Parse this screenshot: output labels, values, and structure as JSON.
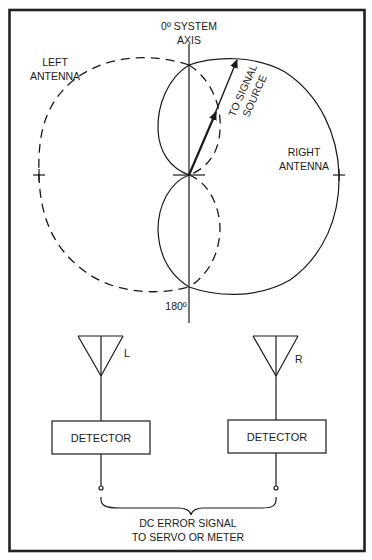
{
  "diagram": {
    "type": "antenna-lobe-comparison",
    "colors": {
      "ink": "#1a1a1a",
      "background": "#ffffff",
      "border": "#222222"
    },
    "labels": {
      "axis_top_line1": "0º SYSTEM",
      "axis_top_line2": "AXIS",
      "axis_bottom": "180º",
      "left_antenna_line1": "LEFT",
      "left_antenna_line2": "ANTENNA",
      "right_antenna_line1": "RIGHT",
      "right_antenna_line2": "ANTENNA",
      "signal_line1": "TO SIGNAL",
      "signal_line2": "SOURCE"
    },
    "antennas": [
      {
        "id": "left",
        "label": "L"
      },
      {
        "id": "right",
        "label": "R"
      }
    ],
    "detectors": [
      {
        "id": "left",
        "label": "DETECTOR"
      },
      {
        "id": "right",
        "label": "DETECTOR"
      }
    ],
    "output": {
      "line1": "DC ERROR SIGNAL",
      "line2": "TO SERVO OR METER"
    },
    "legend": {
      "left_antenna_pattern": "dashed",
      "right_antenna_pattern": "solid"
    }
  }
}
